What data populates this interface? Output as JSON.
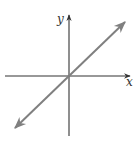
{
  "diagram": {
    "type": "coordinate-plane-line",
    "axes": {
      "x_label": "x",
      "y_label": "y",
      "color": "#333333"
    },
    "line": {
      "description": "Line through origin with positive slope (y = x), arrows on both ends",
      "color": "#808080"
    },
    "geometry": {
      "origin": [
        69,
        76
      ],
      "x_axis": {
        "from": [
          5,
          76
        ],
        "to": [
          131,
          76
        ],
        "arrow_end": "right"
      },
      "y_axis": {
        "from": [
          69,
          136
        ],
        "to": [
          69,
          14
        ],
        "arrow_end": "top"
      },
      "diagonal": {
        "from": [
          14,
          129
        ],
        "to": [
          126,
          21
        ],
        "arrows": "both"
      }
    }
  }
}
